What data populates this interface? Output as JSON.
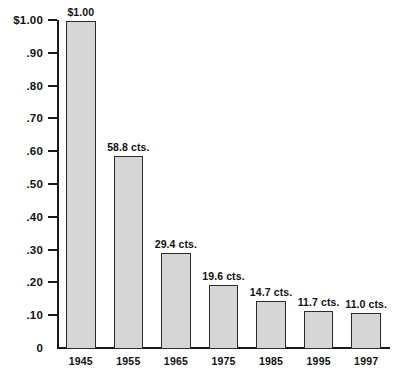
{
  "chart_data": {
    "type": "bar",
    "title": "",
    "subtitle": "",
    "xlabel": "",
    "ylabel": "",
    "categories": [
      "1945",
      "1955",
      "1965",
      "1975",
      "1985",
      "1995",
      "1997"
    ],
    "values": [
      1.0,
      0.588,
      0.294,
      0.196,
      0.147,
      0.117,
      0.11
    ],
    "data_labels": [
      "$1.00",
      "58.8 cts.",
      "29.4 cts.",
      "19.6 cts.",
      "14.7 cts.",
      "11.7 cts.",
      "11.0 cts."
    ],
    "ylim": [
      0,
      1.0
    ],
    "y_ticks": [
      1.0,
      0.9,
      0.8,
      0.7,
      0.6,
      0.5,
      0.4,
      0.3,
      0.2,
      0.1,
      0
    ],
    "y_tick_labels": [
      "$1.00",
      ".90",
      ".80",
      ".70",
      ".60",
      ".50",
      ".40",
      ".30",
      ".20",
      ".10",
      "0"
    ],
    "grid": false,
    "legend": false,
    "legend_position": "none",
    "series": [
      {
        "name": "value",
        "values": [
          1.0,
          0.588,
          0.294,
          0.196,
          0.147,
          0.117,
          0.11
        ]
      }
    ],
    "colors": {
      "bar_fill": "#d6d6d6",
      "bar_border": "#2b2b2b",
      "axis": "#1a1a1a",
      "text": "#111111",
      "background": "#ffffff"
    }
  }
}
